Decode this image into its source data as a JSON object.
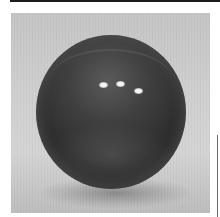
{
  "image": {
    "subject": "dark glossy sphere",
    "background": "light gray backdrop",
    "highlights_count": 3,
    "colors": {
      "sphere": "#2e2e2e",
      "backdrop": "#cfcfcf",
      "frame_line": "#1a1a1a"
    }
  }
}
